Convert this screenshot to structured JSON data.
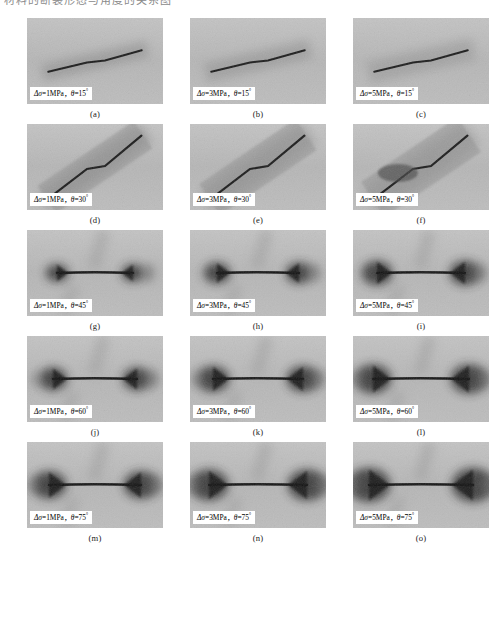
{
  "top_text": "材料的断裂形态与角度的关系图",
  "figure": {
    "symbols": {
      "delta_sigma": "Δσ",
      "theta": "θ",
      "degree": "°",
      "comma": "，",
      "unit": "MPa"
    },
    "rows": [
      {
        "angle": "15",
        "panels": [
          {
            "caption": "(a)",
            "stress": "1",
            "unit": "MPa",
            "angle": "15",
            "label_prefix": "Δσ=",
            "label_mid": "，",
            "label_theta": "θ=",
            "label": "Δσ=1MPa，θ=15°",
            "alt": "shallow near-horizontal crack with diffuse shear band"
          },
          {
            "caption": "(b)",
            "stress": "3",
            "unit": "MPa",
            "angle": "15",
            "label_prefix": "Δσ=",
            "label_mid": "，",
            "label_theta": "θ=",
            "label": "Δσ=3MPa，θ=15°",
            "alt": "shallow crack with broader shear band"
          },
          {
            "caption": "(c)",
            "stress": "5",
            "unit": "MPa",
            "angle": "15",
            "label_prefix": "Δσ=",
            "label_mid": "，",
            "label_theta": "θ=",
            "label": "Δσ=5MPa，θ=15°",
            "alt": "thin shallow crack, faint band"
          }
        ]
      },
      {
        "angle": "30",
        "panels": [
          {
            "caption": "(d)",
            "stress": "1",
            "unit": "MPa",
            "angle": "30",
            "label_prefix": "Δσ=",
            "label_mid": "，",
            "label_theta": "θ=",
            "label": "Δσ=1MPa，θ=30°",
            "alt": "inclined crack along 30 degree dark band"
          },
          {
            "caption": "(e)",
            "stress": "3",
            "unit": "MPa",
            "angle": "30",
            "label_prefix": "Δσ=",
            "label_mid": "，",
            "label_theta": "θ=",
            "label": "Δσ=3MPa，θ=30°",
            "alt": "inclined crack, wide dark diagonal zone"
          },
          {
            "caption": "(f)",
            "stress": "5",
            "unit": "MPa",
            "angle": "30",
            "label_prefix": "Δσ=",
            "label_mid": "，",
            "label_theta": "θ=",
            "label": "Δσ=5MPa，θ=30°",
            "alt": "inclined crack with dark lobe at left end"
          }
        ]
      },
      {
        "angle": "45",
        "panels": [
          {
            "caption": "(g)",
            "stress": "1",
            "unit": "MPa",
            "angle": "45",
            "label_prefix": "Δσ=",
            "label_mid": "，",
            "label_theta": "θ=",
            "label": "Δσ=1MPa，θ=45°",
            "alt": "horizontal crack with dark clusters at both tips"
          },
          {
            "caption": "(h)",
            "stress": "3",
            "unit": "MPa",
            "angle": "45",
            "label_prefix": "Δσ=",
            "label_mid": "，",
            "label_theta": "θ=",
            "label": "Δσ=3MPa，θ=45°",
            "alt": "horizontal crack with large dark tip zones"
          },
          {
            "caption": "(i)",
            "stress": "5",
            "unit": "MPa",
            "angle": "45",
            "label_prefix": "Δσ=",
            "label_mid": "，",
            "label_theta": "θ=",
            "label": "Δσ=5MPa，θ=45°",
            "alt": "bowtie shaped dark damage zones"
          }
        ]
      },
      {
        "angle": "60",
        "panels": [
          {
            "caption": "(j)",
            "stress": "1",
            "unit": "MPa",
            "angle": "60",
            "label_prefix": "Δσ=",
            "label_mid": "，",
            "label_theta": "θ=",
            "label": "Δσ=1MPa，θ=60°",
            "alt": "horizontal crack with dense dark tips and side blob"
          },
          {
            "caption": "(k)",
            "stress": "3",
            "unit": "MPa",
            "angle": "60",
            "label_prefix": "Δσ=",
            "label_mid": "，",
            "label_theta": "θ=",
            "label": "Δσ=3MPa，θ=60°",
            "alt": "horizontal crack, dark ends"
          },
          {
            "caption": "(l)",
            "stress": "5",
            "unit": "MPa",
            "angle": "60",
            "label_prefix": "Δσ=",
            "label_mid": "，",
            "label_theta": "θ=",
            "label": "Δσ=5MPa，θ=60°",
            "alt": "horizontal crack, dark left end"
          }
        ]
      },
      {
        "angle": "75",
        "panels": [
          {
            "caption": "(m)",
            "stress": "1",
            "unit": "MPa",
            "angle": "75",
            "label_prefix": "Δσ=",
            "label_mid": "，",
            "label_theta": "θ=",
            "label": "Δσ=1MPa，θ=75°",
            "alt": "bowtie dark zones around horizontal crack"
          },
          {
            "caption": "(n)",
            "stress": "3",
            "unit": "MPa",
            "angle": "75",
            "label_prefix": "Δσ=",
            "label_mid": "，",
            "label_theta": "θ=",
            "label": "Δσ=3MPa，θ=75°",
            "alt": "bowtie dark zones, wider"
          },
          {
            "caption": "(o)",
            "stress": "5",
            "unit": "MPa",
            "angle": "75",
            "label_prefix": "Δσ=",
            "label_mid": "，",
            "label_theta": "θ=",
            "label": "Δσ=5MPa，θ=75°",
            "alt": "compact dark zones at crack ends"
          }
        ]
      }
    ]
  },
  "chart_data": {
    "type": "heatmap",
    "xlabel": "Stress amplitude Δσ (MPa)",
    "ylabel": "Flaw inclination θ (°)",
    "categories": [
      "1",
      "3",
      "5"
    ],
    "rows": [
      "15",
      "30",
      "45",
      "60",
      "75"
    ],
    "panel_labels": [
      [
        "(a)",
        "(b)",
        "(c)"
      ],
      [
        "(d)",
        "(e)",
        "(f)"
      ],
      [
        "(g)",
        "(h)",
        "(i)"
      ],
      [
        "(j)",
        "(k)",
        "(l)"
      ],
      [
        "(m)",
        "(n)",
        "(o)"
      ]
    ],
    "grid": false,
    "legend": "none"
  }
}
